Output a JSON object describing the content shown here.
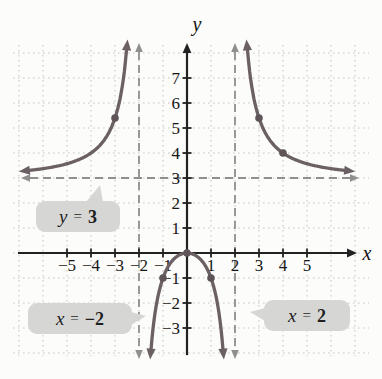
{
  "chart_data": {
    "type": "line",
    "xlabel": "x",
    "ylabel": "y",
    "xlim": [
      -7,
      7
    ],
    "ylim": [
      -4.3,
      8.6
    ],
    "grid": true,
    "x_ticks": [
      -5,
      -4,
      -3,
      -2,
      -1,
      1,
      2,
      3,
      4,
      5
    ],
    "y_ticks": [
      -3,
      -2,
      -1,
      1,
      2,
      3,
      4,
      5,
      6,
      7
    ],
    "vertical_asymptotes": [
      -2,
      2
    ],
    "horizontal_asymptote": 3,
    "curve": {
      "numerator_coefficient": 3,
      "denominator_constant": -4,
      "branches": [
        [
          -6.55,
          -2.52
        ],
        [
          -1.497,
          1.497
        ],
        [
          2.52,
          6.55
        ]
      ]
    },
    "marked_points": [
      [
        -3,
        5.4
      ],
      [
        -1,
        -1
      ],
      [
        0,
        0
      ],
      [
        1,
        -1
      ],
      [
        3,
        5.4
      ],
      [
        4,
        4
      ]
    ],
    "colors": {
      "curve": "#6b6063",
      "point": "#5f5558",
      "asymptote": "#8f8f8d",
      "grid": "#c6c6c4",
      "axis": "#222222",
      "tick_label": "#161616"
    }
  },
  "callouts": {
    "y3": {
      "variable": "y",
      "equals": "=",
      "value": "3"
    },
    "xneg2": {
      "variable": "x",
      "equals": "=",
      "value": "−2"
    },
    "x2": {
      "variable": "x",
      "equals": "=",
      "value": "2"
    }
  }
}
